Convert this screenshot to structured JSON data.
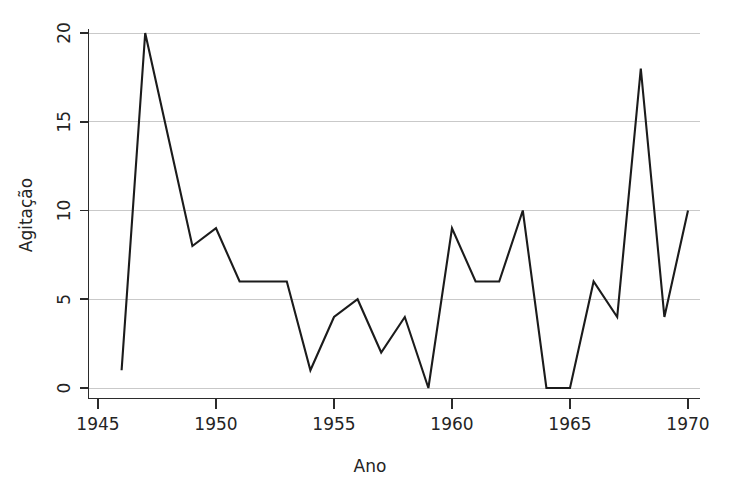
{
  "chart_data": {
    "type": "line",
    "title": "",
    "subtitle": "",
    "xlabel": "Ano",
    "ylabel": "Agitação",
    "xlim": [
      1945,
      1970
    ],
    "ylim": [
      0,
      20
    ],
    "xticks": [
      1945,
      1950,
      1955,
      1960,
      1965,
      1970
    ],
    "xtick_labels": [
      "1945",
      "1950",
      "1955",
      "1960",
      "1965",
      "1970"
    ],
    "yticks": [
      0,
      5,
      10,
      15,
      20
    ],
    "ytick_labels": [
      "0",
      "5",
      "10",
      "15",
      "20"
    ],
    "grid": "horizontal",
    "legend": "none",
    "line_color": "#1b1b1b",
    "grid_color": "#c9c9c9",
    "axis_color": "#2b2b2b",
    "background_color": "#ffffff",
    "x": [
      1946,
      1947,
      1948,
      1949,
      1950,
      1951,
      1952,
      1953,
      1954,
      1955,
      1956,
      1957,
      1958,
      1959,
      1960,
      1961,
      1962,
      1963,
      1964,
      1965,
      1966,
      1967,
      1968,
      1969,
      1970
    ],
    "values": [
      1,
      20,
      14,
      8,
      9,
      6,
      6,
      6,
      1,
      4,
      5,
      2,
      4,
      0,
      9,
      6,
      6,
      10,
      0,
      0,
      6,
      4,
      18,
      4,
      10
    ],
    "series": [
      {
        "name": "Agitação",
        "values": [
          1,
          20,
          14,
          8,
          9,
          6,
          6,
          6,
          1,
          4,
          5,
          2,
          4,
          0,
          9,
          6,
          6,
          10,
          0,
          0,
          6,
          4,
          18,
          4,
          10
        ]
      }
    ]
  },
  "axes": {
    "x_title": "Ano",
    "y_title": "Agitação"
  },
  "x_tick_labels": {
    "t0": "1945",
    "t1": "1950",
    "t2": "1955",
    "t3": "1960",
    "t4": "1965",
    "t5": "1970"
  },
  "y_tick_labels": {
    "t0": "0",
    "t1": "5",
    "t2": "10",
    "t3": "15",
    "t4": "20"
  }
}
